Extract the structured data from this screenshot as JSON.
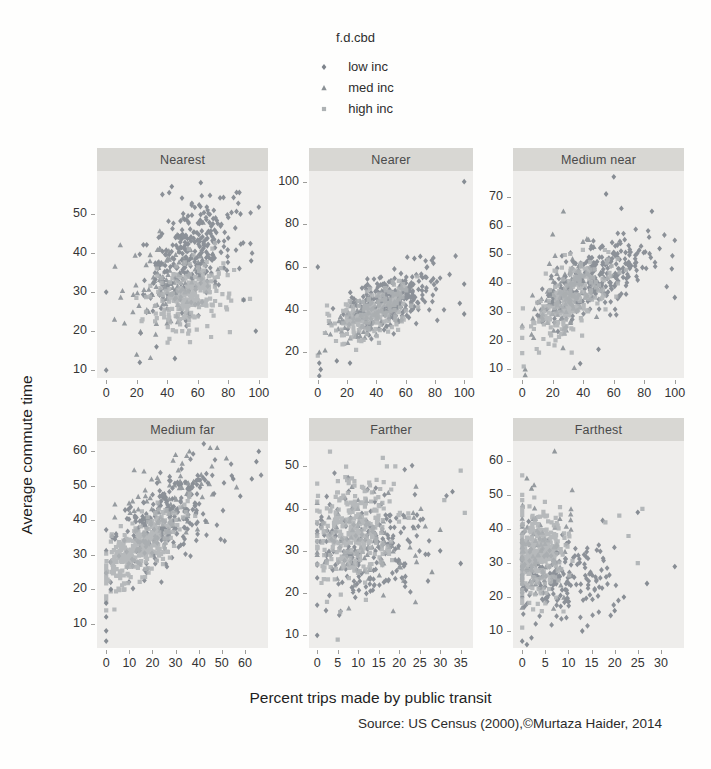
{
  "chart_data": {
    "type": "scatter",
    "layout": "trellis-2x3",
    "xlabel": "Percent trips made by public transit",
    "ylabel": "Average commute time",
    "source": "Source: US Census (2000),©Murtaza Haider, 2014",
    "panel_bg": "#eeedeb",
    "strip_bg": "#d8d7d3",
    "legend": {
      "title": "f.d.cbd",
      "entries": [
        {
          "label": "low inc",
          "marker": "diamond",
          "color": "#7e848c"
        },
        {
          "label": "med inc",
          "marker": "triangle",
          "color": "#8a9095"
        },
        {
          "label": "high inc",
          "marker": "square",
          "color": "#aeb2b4"
        }
      ]
    },
    "panels": [
      {
        "title": "Nearest",
        "xlim": [
          -6,
          106
        ],
        "ylim": [
          8,
          61
        ],
        "xrange": [
          0,
          100
        ],
        "xticks": [
          0,
          20,
          40,
          60,
          80,
          100
        ],
        "yticks": [
          10,
          20,
          30,
          40,
          50
        ],
        "clusters": [
          {
            "series": "low inc",
            "n": 280,
            "cx": 57,
            "cy": 40,
            "sx": 14,
            "sy": 7.5,
            "rho": 0.45
          },
          {
            "series": "med inc",
            "n": 110,
            "cx": 42,
            "cy": 33,
            "sx": 13,
            "sy": 6.5,
            "rho": 0.35
          },
          {
            "series": "high inc",
            "n": 260,
            "cx": 55,
            "cy": 29,
            "sx": 12,
            "sy": 4.5,
            "rho": 0.25
          }
        ],
        "outliers": [
          {
            "series": "low inc",
            "points": [
              [
                0,
                30
              ],
              [
                0,
                10
              ],
              [
                98,
                20
              ],
              [
                90,
                28
              ],
              [
                88,
                50
              ],
              [
                62,
                58
              ],
              [
                43,
                57
              ],
              [
                33,
                16
              ],
              [
                22,
                12
              ],
              [
                45,
                13
              ],
              [
                95,
                38
              ]
            ]
          },
          {
            "series": "med inc",
            "points": [
              [
                20,
                14
              ],
              [
                12,
                22
              ]
            ]
          }
        ]
      },
      {
        "title": "Nearer",
        "xlim": [
          -6,
          106
        ],
        "ylim": [
          8,
          105
        ],
        "xrange": [
          0,
          100
        ],
        "xticks": [
          0,
          20,
          40,
          60,
          80,
          100
        ],
        "yticks": [
          20,
          40,
          60,
          80,
          100
        ],
        "clusters": [
          {
            "series": "low inc",
            "n": 260,
            "cx": 52,
            "cy": 45,
            "sx": 16,
            "sy": 7,
            "rho": 0.5
          },
          {
            "series": "med inc",
            "n": 90,
            "cx": 33,
            "cy": 37,
            "sx": 12,
            "sy": 6,
            "rho": 0.4
          },
          {
            "series": "high inc",
            "n": 240,
            "cx": 38,
            "cy": 39,
            "sx": 13,
            "sy": 6,
            "rho": 0.5
          }
        ],
        "outliers": [
          {
            "series": "low inc",
            "points": [
              [
                100,
                100
              ],
              [
                0,
                60
              ],
              [
                100,
                52
              ],
              [
                97,
                43
              ],
              [
                1,
                15
              ],
              [
                2,
                12
              ],
              [
                1,
                9
              ],
              [
                100,
                38
              ],
              [
                13,
                16
              ],
              [
                22,
                15
              ],
              [
                70,
                65
              ],
              [
                66,
                64
              ]
            ]
          },
          {
            "series": "med inc",
            "points": [
              [
                1,
                20
              ],
              [
                5,
                21
              ]
            ]
          }
        ]
      },
      {
        "title": "Medium near",
        "xlim": [
          -6,
          106
        ],
        "ylim": [
          7,
          79
        ],
        "xrange": [
          0,
          100
        ],
        "xticks": [
          0,
          20,
          40,
          60,
          80,
          100
        ],
        "yticks": [
          10,
          20,
          30,
          40,
          50,
          60,
          70
        ],
        "clusters": [
          {
            "series": "low inc",
            "n": 280,
            "cx": 50,
            "cy": 42,
            "sx": 16,
            "sy": 7,
            "rho": 0.55
          },
          {
            "series": "med inc",
            "n": 100,
            "cx": 27,
            "cy": 36,
            "sx": 12,
            "sy": 8,
            "rho": 0.5
          },
          {
            "series": "high inc",
            "n": 260,
            "cx": 32,
            "cy": 35,
            "sx": 13,
            "sy": 7,
            "rho": 0.65
          }
        ],
        "outliers": [
          {
            "series": "low inc",
            "points": [
              [
                60,
                77
              ],
              [
                85,
                65
              ],
              [
                65,
                66
              ],
              [
                100,
                35
              ],
              [
                55,
                71
              ],
              [
                90,
                52
              ],
              [
                98,
                45
              ],
              [
                50,
                17
              ],
              [
                38,
                12
              ]
            ]
          },
          {
            "series": "med inc",
            "points": [
              [
                27,
                65
              ],
              [
                2,
                8
              ],
              [
                20,
                57
              ],
              [
                2,
                10
              ]
            ]
          },
          {
            "series": "high inc",
            "points": [
              [
                1,
                11
              ]
            ]
          }
        ]
      },
      {
        "title": "Medium far",
        "xlim": [
          -4,
          70
        ],
        "ylim": [
          3,
          63
        ],
        "xrange": [
          0,
          67
        ],
        "xticks": [
          0,
          10,
          20,
          30,
          40,
          50,
          60
        ],
        "yticks": [
          10,
          20,
          30,
          40,
          50,
          60
        ],
        "clusters": [
          {
            "series": "low inc",
            "n": 240,
            "cx": 27,
            "cy": 40,
            "sx": 12,
            "sy": 7.5,
            "rho": 0.55
          },
          {
            "series": "med inc",
            "n": 80,
            "cx": 28,
            "cy": 46,
            "sx": 10,
            "sy": 6,
            "rho": 0.4
          },
          {
            "series": "high inc",
            "n": 330,
            "cx": 14,
            "cy": 32,
            "sx": 8.5,
            "sy": 5.5,
            "rho": 0.65
          }
        ],
        "outliers": [
          {
            "series": "low inc",
            "points": [
              [
                0,
                5
              ],
              [
                0,
                8
              ],
              [
                0,
                12
              ],
              [
                0,
                16
              ],
              [
                66,
                60
              ],
              [
                65,
                57
              ],
              [
                63,
                52
              ],
              [
                55,
                52
              ],
              [
                58,
                47
              ],
              [
                2,
                20
              ]
            ]
          },
          {
            "series": "med inc",
            "points": [
              [
                45,
                61
              ],
              [
                48,
                61
              ],
              [
                36,
                60
              ],
              [
                30,
                59
              ],
              [
                52,
                58
              ]
            ]
          }
        ]
      },
      {
        "title": "Farther",
        "xlim": [
          -2,
          38
        ],
        "ylim": [
          7,
          56
        ],
        "xrange": [
          0,
          36
        ],
        "xticks": [
          0,
          5,
          10,
          15,
          20,
          25,
          30,
          35
        ],
        "yticks": [
          10,
          20,
          30,
          40,
          50
        ],
        "clusters": [
          {
            "series": "low inc",
            "n": 200,
            "cx": 12,
            "cy": 31,
            "sx": 7.5,
            "sy": 7,
            "rho": 0.15
          },
          {
            "series": "med inc",
            "n": 70,
            "cx": 13,
            "cy": 32,
            "sx": 7,
            "sy": 6,
            "rho": 0.1
          },
          {
            "series": "high inc",
            "n": 340,
            "cx": 8,
            "cy": 34,
            "sx": 5,
            "sy": 6,
            "rho": 0.1
          }
        ],
        "outliers": [
          {
            "series": "low inc",
            "points": [
              [
                0,
                10
              ],
              [
                33,
                44
              ],
              [
                30,
                30
              ],
              [
                35,
                27
              ]
            ]
          },
          {
            "series": "med inc",
            "points": [
              [
                30,
                35
              ],
              [
                28,
                25
              ]
            ]
          },
          {
            "series": "high inc",
            "points": [
              [
                5,
                9
              ],
              [
                16,
                52
              ],
              [
                17,
                50
              ],
              [
                35,
                49
              ],
              [
                36,
                39
              ],
              [
                31,
                42
              ]
            ]
          }
        ]
      },
      {
        "title": "Farthest",
        "xlim": [
          -2,
          35
        ],
        "ylim": [
          5,
          66
        ],
        "xrange": [
          0,
          33
        ],
        "xticks": [
          0,
          5,
          10,
          15,
          20,
          25,
          30
        ],
        "yticks": [
          10,
          20,
          30,
          40,
          50,
          60
        ],
        "clusters": [
          {
            "series": "low inc",
            "n": 210,
            "cx": 8,
            "cy": 26,
            "sx": 6,
            "sy": 6,
            "rho": 0.1
          },
          {
            "series": "med inc",
            "n": 60,
            "cx": 4,
            "cy": 36,
            "sx": 3.5,
            "sy": 8,
            "rho": 0
          },
          {
            "series": "high inc",
            "n": 330,
            "cx": 3.5,
            "cy": 33,
            "sx": 2.8,
            "sy": 6.5,
            "rho": 0.05
          }
        ],
        "outliers": [
          {
            "series": "low inc",
            "points": [
              [
                25,
                45
              ],
              [
                33,
                29
              ],
              [
                0,
                7
              ],
              [
                1,
                6
              ],
              [
                2,
                8
              ],
              [
                13,
                10
              ],
              [
                20,
                16
              ],
              [
                27,
                24
              ],
              [
                22,
                20
              ]
            ]
          },
          {
            "series": "med inc",
            "points": [
              [
                7,
                63
              ],
              [
                1,
                55
              ],
              [
                2,
                52
              ]
            ]
          },
          {
            "series": "high inc",
            "points": [
              [
                26,
                46
              ],
              [
                23,
                38
              ],
              [
                21,
                44
              ],
              [
                18,
                42
              ],
              [
                25,
                30
              ]
            ]
          }
        ]
      }
    ]
  }
}
